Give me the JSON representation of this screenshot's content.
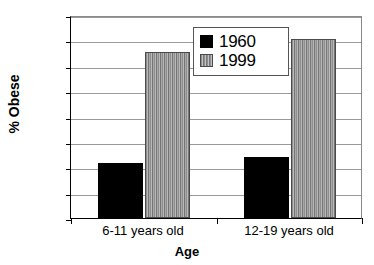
{
  "chart_data": {
    "type": "bar",
    "title": "",
    "categories": [
      "6-11 years old",
      "12-19 years old"
    ],
    "series": [
      {
        "name": "1960",
        "values": [
          4.3,
          4.8
        ],
        "color": "#000000"
      },
      {
        "name": "1999",
        "values": [
          13.1,
          14.1
        ],
        "color": "#9a9a9a"
      }
    ],
    "xlabel": "Age",
    "ylabel": "% Obese",
    "ylim": [
      0,
      16
    ],
    "ytick_labels": [
      "0%",
      "2%",
      "4%",
      "6%",
      "8%",
      "10%",
      "12%",
      "14%",
      "16%"
    ],
    "ytick_values": [
      0,
      2,
      4,
      6,
      8,
      10,
      12,
      14,
      16
    ],
    "grid": true,
    "legend_position": "top-center"
  },
  "legend": {
    "entries": [
      {
        "label": "1960",
        "swatch": "black-square-icon"
      },
      {
        "label": "1999",
        "swatch": "gray-hatched-square-icon"
      }
    ]
  }
}
